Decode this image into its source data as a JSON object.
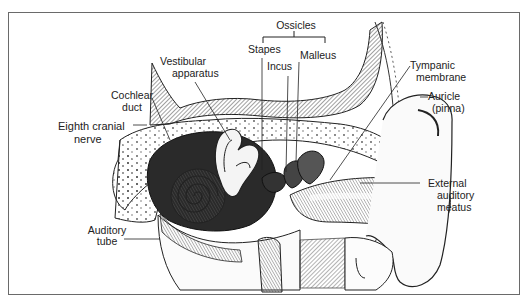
{
  "diagram": {
    "group_label": "Ossicles",
    "labels": {
      "ossicles": "Ossicles",
      "stapes": "Stapes",
      "incus": "Incus",
      "malleus": "Malleus",
      "vestibular_1": "Vestibular",
      "vestibular_2": "apparatus",
      "cochlear_1": "Cochlear",
      "cochlear_2": "duct",
      "eighth_1": "Eighth cranial",
      "eighth_2": "nerve",
      "tympanic_1": "Tympanic",
      "tympanic_2": "membrane",
      "auricle_1": "Auricle",
      "auricle_2": "(pinna)",
      "external_1": "External",
      "external_2": "auditory",
      "external_3": "meatus",
      "auditory_1": "Auditory",
      "auditory_2": "tube"
    },
    "colors": {
      "ink": "#222222",
      "frame": "#6a6a6a",
      "shade": "#555555",
      "background": "#ffffff"
    }
  }
}
